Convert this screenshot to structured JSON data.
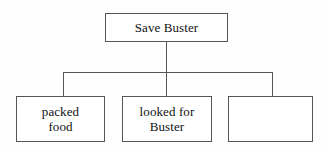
{
  "diagram": {
    "type": "tree-chart",
    "orientation": "top-down",
    "background_color": "#fefefe",
    "line_color": "#55555a",
    "text_color": "#111114",
    "root": {
      "label": "Save Buster"
    },
    "children": [
      {
        "label": "packed\nfood"
      },
      {
        "label": "looked for\nBuster"
      },
      {
        "label": ""
      }
    ]
  }
}
